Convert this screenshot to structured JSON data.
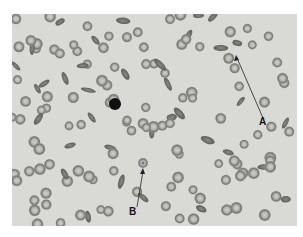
{
  "figure": {
    "labels": [
      {
        "id": "A",
        "text": "A",
        "x": 263,
        "y": 126,
        "target": [
          236,
          56
        ]
      },
      {
        "id": "B",
        "text": "B",
        "x": 130,
        "y": 215,
        "target": [
          143,
          168
        ]
      }
    ],
    "colors": {
      "background": "#d9d9d6",
      "cell_rim": "#7d7d7a",
      "cell_center": "#c9c9c5",
      "nucleus": "#111111"
    }
  }
}
